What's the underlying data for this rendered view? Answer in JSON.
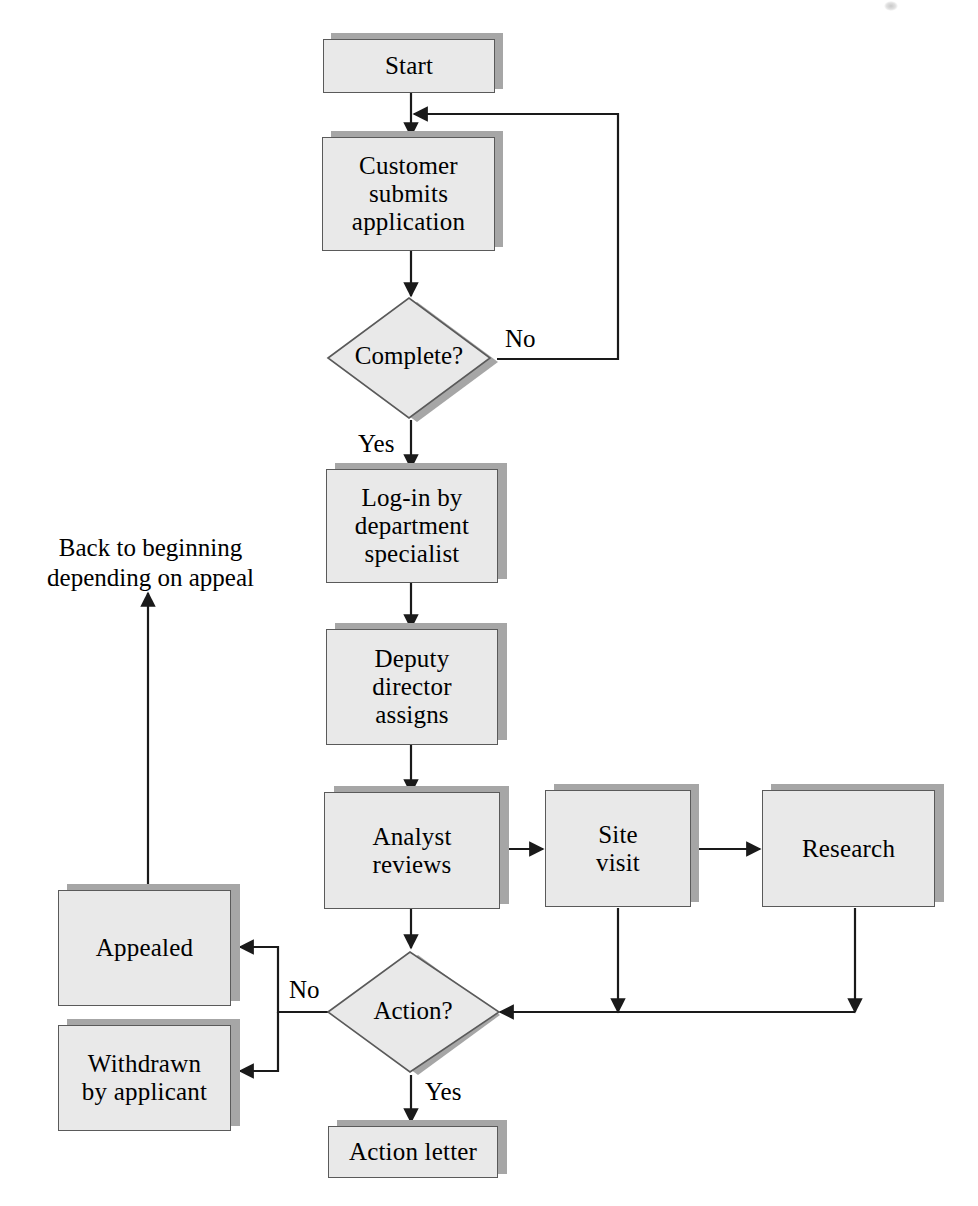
{
  "diagram": {
    "fill_color": "#e9e9e9",
    "border_color": "#5a5a5a",
    "shadow_color": "#a6a6a6",
    "line_color": "#1a1a1a",
    "background_color": "#ffffff"
  },
  "nodes": {
    "start": {
      "label": "Start",
      "shape": "process"
    },
    "customer_submits": {
      "label": "Customer\nsubmits\napplication",
      "shape": "process"
    },
    "complete_decision": {
      "label": "Complete?",
      "shape": "decision"
    },
    "login": {
      "label": "Log-in by\ndepartment\nspecialist",
      "shape": "process"
    },
    "deputy": {
      "label": "Deputy\ndirector\nassigns",
      "shape": "process"
    },
    "analyst": {
      "label": "Analyst\nreviews",
      "shape": "process"
    },
    "site_visit": {
      "label": "Site\nvisit",
      "shape": "process"
    },
    "research": {
      "label": "Research",
      "shape": "process"
    },
    "action_decision": {
      "label": "Action?",
      "shape": "decision"
    },
    "appealed": {
      "label": "Appealed",
      "shape": "process"
    },
    "withdrawn": {
      "label": "Withdrawn\nby applicant",
      "shape": "process"
    },
    "action_letter": {
      "label": "Action letter",
      "shape": "process"
    }
  },
  "edge_labels": {
    "complete_no": "No",
    "complete_yes": "Yes",
    "action_no": "No",
    "action_yes": "Yes"
  },
  "notes": {
    "back_to_beginning": "Back to beginning\ndepending on appeal"
  }
}
